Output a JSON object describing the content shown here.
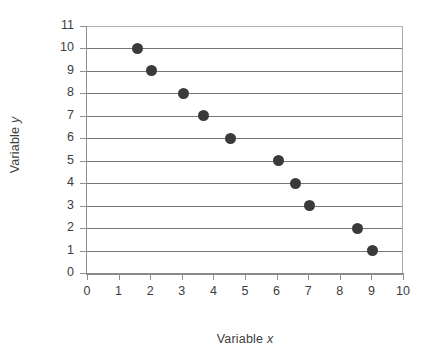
{
  "chart_data": {
    "type": "scatter",
    "title": "",
    "xlabel": "Variable x",
    "ylabel": "Variable y",
    "xlim": [
      0,
      10
    ],
    "ylim": [
      0,
      11
    ],
    "grid": true,
    "grid_orientation": "horizontal",
    "legend": null,
    "marker_color": "#3a3a3a",
    "gridline_color": "#777777",
    "axis_color": "#8e8e8e",
    "x": [
      1.6,
      2.05,
      3.05,
      3.7,
      4.55,
      6.05,
      6.6,
      7.05,
      8.55,
      9.05
    ],
    "y": [
      10,
      9,
      8,
      7,
      6,
      5,
      4,
      3,
      2,
      1
    ],
    "points": [
      {
        "x": 1.6,
        "y": 10
      },
      {
        "x": 2.05,
        "y": 9
      },
      {
        "x": 3.05,
        "y": 8
      },
      {
        "x": 3.7,
        "y": 7
      },
      {
        "x": 4.55,
        "y": 6
      },
      {
        "x": 6.05,
        "y": 5
      },
      {
        "x": 6.6,
        "y": 4
      },
      {
        "x": 7.05,
        "y": 3
      },
      {
        "x": 8.55,
        "y": 2
      },
      {
        "x": 9.05,
        "y": 1
      }
    ],
    "xticks": [
      0,
      1,
      2,
      3,
      4,
      5,
      6,
      7,
      8,
      9,
      10
    ],
    "xtick_labels": [
      "0",
      "1",
      "2",
      "3",
      "4",
      "5",
      "6",
      "7",
      "8",
      "9",
      "10"
    ],
    "yticks": [
      0,
      1,
      2,
      3,
      4,
      5,
      6,
      7,
      8,
      9,
      10,
      11
    ],
    "ytick_labels": [
      "0",
      "1",
      "2",
      "3",
      "4",
      "5",
      "6",
      "7",
      "8",
      "9",
      "10",
      "11"
    ],
    "gridlines_at": [
      1,
      2,
      3,
      4,
      5,
      6,
      7,
      8,
      9,
      10,
      11
    ]
  },
  "axes": {
    "x_title_prefix": "Variable ",
    "x_title_variable": "x",
    "y_title_prefix": "Variable ",
    "y_title_variable": "y"
  }
}
